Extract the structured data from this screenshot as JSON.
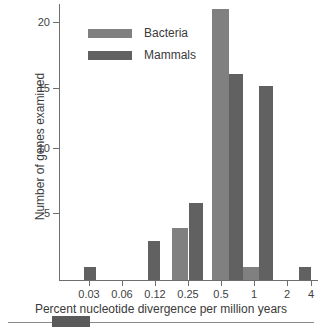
{
  "chart_data": {
    "type": "bar",
    "title": "",
    "xlabel": "Percent nucleotide divergence per million years",
    "ylabel": "Number of genes examined",
    "xtick_labels": [
      "0.03",
      "0.06",
      "0.12",
      "0.25",
      "0.5",
      "1",
      "2",
      "4"
    ],
    "xtick_px": [
      89,
      122,
      155,
      188,
      221,
      254,
      287,
      311
    ],
    "ytick_labels": [
      "20",
      "15",
      "10",
      "5"
    ],
    "ytick_values": [
      20,
      15,
      10,
      5
    ],
    "ylim": [
      0,
      22
    ],
    "xscale": "log2-binned",
    "grid": false,
    "legend_position": "upper-left-inside",
    "series": [
      {
        "name": "Bacteria",
        "color": "#808080",
        "bars": [
          {
            "bin_label": "0.25",
            "value": 4,
            "x_px": 172,
            "w_px": 16
          },
          {
            "bin_label": "0.5",
            "value": 21,
            "x_px": 212,
            "w_px": 17
          },
          {
            "bin_label": "1",
            "value": 1,
            "x_px": 243,
            "w_px": 16
          }
        ]
      },
      {
        "name": "Mammals",
        "color": "#616161",
        "bars": [
          {
            "bin_label": "0.03",
            "value": 1,
            "x_px": 84,
            "w_px": 12
          },
          {
            "bin_label": "0.12",
            "value": 3,
            "x_px": 148,
            "w_px": 12
          },
          {
            "bin_label": "0.35",
            "value": 6,
            "x_px": 189,
            "w_px": 14
          },
          {
            "bin_label": "0.7",
            "value": 16,
            "x_px": 229,
            "w_px": 14
          },
          {
            "bin_label": "1.6",
            "value": 15,
            "x_px": 259,
            "w_px": 14
          },
          {
            "bin_label": "3.4",
            "value": 1,
            "x_px": 299,
            "w_px": 12
          }
        ]
      }
    ]
  },
  "axes": {
    "y_title": "Number of genes examined",
    "x_title": "Percent nucleotide divergence per million years",
    "y_ticks": [
      {
        "label": "20",
        "top_px": 22
      },
      {
        "label": "15",
        "top_px": 88
      },
      {
        "label": "10",
        "top_px": 148
      },
      {
        "label": "5",
        "top_px": 213
      }
    ],
    "x_ticks": [
      {
        "label": "0.03",
        "left_px": 89
      },
      {
        "label": "0.06",
        "left_px": 122
      },
      {
        "label": "0.12",
        "left_px": 155
      },
      {
        "label": "0.25",
        "left_px": 188
      },
      {
        "label": "0.5",
        "left_px": 221
      },
      {
        "label": "1",
        "left_px": 254
      },
      {
        "label": "2",
        "left_px": 287
      },
      {
        "label": "4",
        "left_px": 311
      }
    ]
  },
  "legend": {
    "items": [
      {
        "label": "Bacteria",
        "color": "#808080"
      },
      {
        "label": "Mammals",
        "color": "#616161"
      }
    ]
  }
}
